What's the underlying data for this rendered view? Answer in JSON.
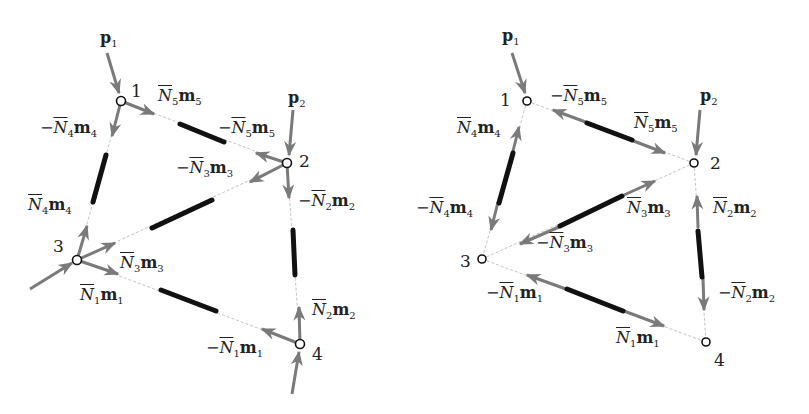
{
  "colors": {
    "arrow": "#7a7a7a",
    "bar": "#111111",
    "dash": "#bbbbbb",
    "text": "#222222"
  },
  "left_panel": {
    "nodes": [
      {
        "id": "1",
        "x": 121,
        "y": 101
      },
      {
        "id": "2",
        "x": 287,
        "y": 163
      },
      {
        "id": "3",
        "x": 77,
        "y": 260
      },
      {
        "id": "4",
        "x": 300,
        "y": 344
      }
    ],
    "loads": [
      {
        "label": "p",
        "sub": "1"
      },
      {
        "label": "p",
        "sub": "2"
      }
    ],
    "labels": [
      {
        "sign": "",
        "n": "5",
        "x": 158,
        "y": 88
      },
      {
        "sign": "−",
        "n": "5",
        "x": 218,
        "y": 120
      },
      {
        "sign": "−",
        "n": "4",
        "x": 40,
        "y": 120
      },
      {
        "sign": "−",
        "n": "3",
        "x": 176,
        "y": 160
      },
      {
        "sign": "−",
        "n": "2",
        "x": 298,
        "y": 193
      },
      {
        "sign": "",
        "n": "4",
        "x": 28,
        "y": 197
      },
      {
        "sign": "",
        "n": "3",
        "x": 120,
        "y": 255
      },
      {
        "sign": "",
        "n": "1",
        "x": 80,
        "y": 287
      },
      {
        "sign": "",
        "n": "2",
        "x": 312,
        "y": 302
      },
      {
        "sign": "−",
        "n": "1",
        "x": 206,
        "y": 340
      }
    ]
  },
  "right_panel": {
    "nodes": [
      {
        "id": "1",
        "x": 527,
        "y": 101
      },
      {
        "id": "2",
        "x": 694,
        "y": 163
      },
      {
        "id": "3",
        "x": 482,
        "y": 259
      },
      {
        "id": "4",
        "x": 706,
        "y": 342
      }
    ],
    "loads": [
      {
        "label": "p",
        "sub": "1"
      },
      {
        "label": "p",
        "sub": "2"
      }
    ],
    "labels": [
      {
        "sign": "−",
        "n": "5",
        "x": 550,
        "y": 88
      },
      {
        "sign": "",
        "n": "5",
        "x": 634,
        "y": 115
      },
      {
        "sign": "",
        "n": "4",
        "x": 457,
        "y": 120
      },
      {
        "sign": "",
        "n": "3",
        "x": 627,
        "y": 200
      },
      {
        "sign": "",
        "n": "2",
        "x": 713,
        "y": 200
      },
      {
        "sign": "−",
        "n": "4",
        "x": 416,
        "y": 200
      },
      {
        "sign": "−",
        "n": "3",
        "x": 536,
        "y": 235
      },
      {
        "sign": "−",
        "n": "1",
        "x": 486,
        "y": 285
      },
      {
        "sign": "−",
        "n": "2",
        "x": 718,
        "y": 285
      },
      {
        "sign": "",
        "n": "1",
        "x": 616,
        "y": 330
      }
    ]
  }
}
